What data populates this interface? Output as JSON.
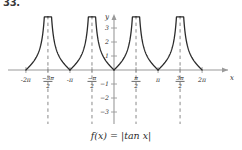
{
  "problem": {
    "number": "33."
  },
  "caption": {
    "text": "f(x) = |tan x|"
  },
  "chart_data": {
    "type": "line",
    "title": "",
    "function": "f(x) = |tan x|",
    "xlabel": "x",
    "ylabel": "y",
    "xlim": [
      -7.2,
      7.2
    ],
    "ylim": [
      -3.6,
      3.9
    ],
    "grid": false,
    "legend": null,
    "xticks": [
      {
        "value": -6.283185,
        "label": "-2π",
        "type": "plain",
        "num": "",
        "den": ""
      },
      {
        "value": -4.712389,
        "label": "-3π/2",
        "type": "fraction",
        "num": "−3π",
        "den": "2"
      },
      {
        "value": -3.141593,
        "label": "-π",
        "type": "plain",
        "num": "",
        "den": ""
      },
      {
        "value": -1.570796,
        "label": "-π/2",
        "type": "fraction",
        "num": "−π",
        "den": "2"
      },
      {
        "value": 1.570796,
        "label": "π/2",
        "type": "fraction",
        "num": "π",
        "den": "2"
      },
      {
        "value": 3.141593,
        "label": "π",
        "type": "plain",
        "num": "",
        "den": ""
      },
      {
        "value": 4.712389,
        "label": "3π/2",
        "type": "fraction",
        "num": "3π",
        "den": "2"
      },
      {
        "value": 6.283185,
        "label": "2π",
        "type": "plain",
        "num": "",
        "den": ""
      }
    ],
    "yticks": [
      {
        "value": 3,
        "label": "3"
      },
      {
        "value": 2,
        "label": "2"
      },
      {
        "value": 1,
        "label": "1"
      },
      {
        "value": -1,
        "label": "−1"
      },
      {
        "value": -2,
        "label": "−2"
      },
      {
        "value": -3,
        "label": "−3"
      }
    ],
    "asymptotes": {
      "style": "dashed",
      "color": "#8a8a8a",
      "x_values": [
        -4.712389,
        -1.570796,
        1.570796,
        4.712389
      ]
    },
    "curve": {
      "color": "#2b2b2b",
      "width": 1.3,
      "branches": [
        {
          "from": -6.283185,
          "to": -4.712389
        },
        {
          "from": -4.712389,
          "to": -3.141593
        },
        {
          "from": -3.141593,
          "to": -1.570796
        },
        {
          "from": -1.570796,
          "to": 0
        },
        {
          "from": 0,
          "to": 1.570796
        },
        {
          "from": 1.570796,
          "to": 3.141593
        },
        {
          "from": 3.141593,
          "to": 4.712389
        },
        {
          "from": 4.712389,
          "to": 6.283185
        }
      ],
      "zeros": [
        -6.283185,
        -3.141593,
        0,
        3.141593,
        6.283185
      ],
      "ymax_clip": 3.8
    },
    "axes": {
      "x_axis_color": "#9a9a9a",
      "y_axis_color": "#9a9a9a",
      "arrows": true
    }
  }
}
